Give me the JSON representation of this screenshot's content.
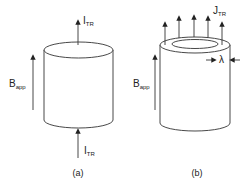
{
  "diagram_a": {
    "caption": "(a)",
    "top_current": {
      "main": "I",
      "sub": "TR"
    },
    "bottom_current": {
      "main": "I",
      "sub": "TR"
    },
    "field": {
      "main": "B",
      "sub": "app"
    }
  },
  "diagram_b": {
    "caption": "(b)",
    "current_density": {
      "main": "J",
      "sub": "TR"
    },
    "penetration_depth": "λ",
    "field": {
      "main": "B",
      "sub": "app"
    }
  },
  "colors": {
    "stroke": "#333333",
    "background": "#ffffff"
  }
}
